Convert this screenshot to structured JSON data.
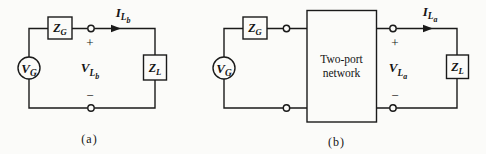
{
  "figure": {
    "background_color": "#fbfbf9",
    "line_color": "#1a1a1a"
  },
  "circuit_a": {
    "caption": "(a)",
    "source": {
      "main": "V",
      "sub": "G"
    },
    "generator_impedance": {
      "main": "Z",
      "sub": "G"
    },
    "load_impedance": {
      "main": "Z",
      "sub": "L"
    },
    "current": {
      "main": "I",
      "sub": "L",
      "subsub": "b"
    },
    "voltage": {
      "main": "V",
      "sub": "L",
      "subsub": "b"
    },
    "plus": "+",
    "minus": "−"
  },
  "circuit_b": {
    "caption": "(b)",
    "source": {
      "main": "V",
      "sub": "G"
    },
    "generator_impedance": {
      "main": "Z",
      "sub": "G"
    },
    "load_impedance": {
      "main": "Z",
      "sub": "L"
    },
    "two_port": {
      "line1": "Two-port",
      "line2": "network"
    },
    "current": {
      "main": "I",
      "sub": "L",
      "subsub": "a"
    },
    "voltage": {
      "main": "V",
      "sub": "L",
      "subsub": "a"
    },
    "plus": "+",
    "minus": "−"
  }
}
